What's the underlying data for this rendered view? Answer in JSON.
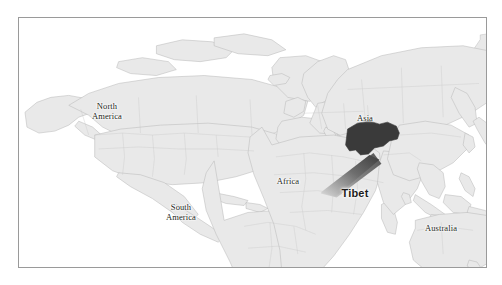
{
  "figure": {
    "kind": "world-map",
    "frame_border_color": "#9a9a9a",
    "background_color": "#ffffff"
  },
  "map": {
    "ocean_color": "#ffffff",
    "land_color": "#e9e9e9",
    "land_stroke_color": "#bfbfbf",
    "coast_stroke_color": "#b0b0b0",
    "labels": [
      {
        "id": "north-america",
        "text": "North\nAmerica"
      },
      {
        "id": "south-america",
        "text": "South\nAmerica"
      },
      {
        "id": "africa",
        "text": "Africa"
      },
      {
        "id": "asia",
        "text": "Asia"
      },
      {
        "id": "australia",
        "text": "Australia"
      }
    ]
  },
  "highlight": {
    "name": "Tibet",
    "label": "Tibet",
    "fill_color": "#3a3a3a",
    "pointer_gradient_from": "#3a3a3a",
    "pointer_gradient_to": "#d4d4d4",
    "label_color": "#1c1c1c"
  }
}
